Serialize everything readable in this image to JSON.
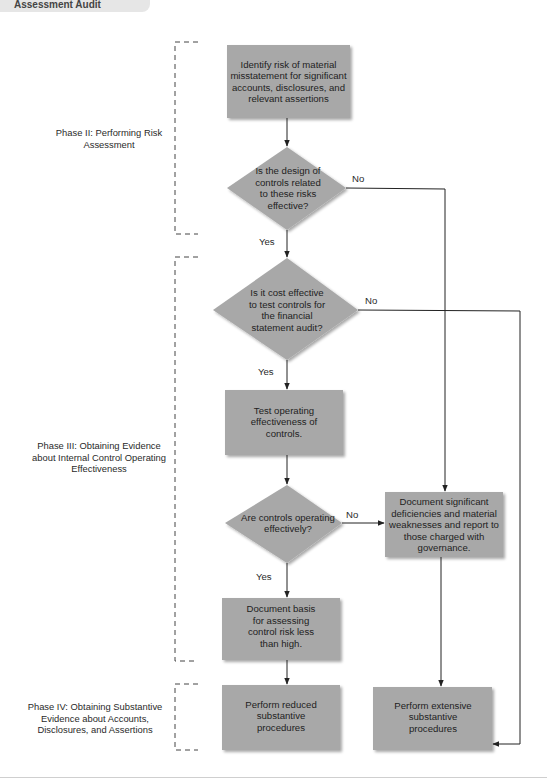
{
  "header": {
    "tab_label": "Assessment Audit"
  },
  "colors": {
    "node_fill": "#a8a8a8",
    "node_shadow": "#c9c9c9",
    "line": "#222222",
    "bracket": "#444444",
    "background": "#ffffff"
  },
  "phases": [
    {
      "id": "phase2",
      "label": "Phase II: Performing Risk Assessment"
    },
    {
      "id": "phase3",
      "label": "Phase III: Obtaining Evidence about Internal Control Operating Effectiveness"
    },
    {
      "id": "phase4",
      "label": "Phase IV: Obtaining Substantive Evidence about Accounts, Disclosures, and Assertions"
    }
  ],
  "nodes": {
    "identify_risk": {
      "type": "process",
      "text": "Identify risk of material misstatement for significant accounts, disclosures, and relevant assertions"
    },
    "design_effective": {
      "type": "decision",
      "text": "Is the design of controls related to these risks effective?"
    },
    "cost_effective": {
      "type": "decision",
      "text": "Is it cost effective to test controls for the financial statement audit?"
    },
    "test_operating": {
      "type": "process",
      "text": "Test operating effectiveness of controls."
    },
    "operating_effectively": {
      "type": "decision",
      "text": "Are controls operating effectively?"
    },
    "document_deficiencies": {
      "type": "process",
      "text": "Document significant deficiencies and material weaknesses and report to those charged with governance."
    },
    "document_basis": {
      "type": "process",
      "text": "Document basis for assessing control risk less than high."
    },
    "reduced_substantive": {
      "type": "process",
      "text": "Perform reduced substantive procedures"
    },
    "extensive_substantive": {
      "type": "process",
      "text": "Perform extensive substantive procedures"
    }
  },
  "edges": [
    {
      "from": "identify_risk",
      "to": "design_effective",
      "label": ""
    },
    {
      "from": "design_effective",
      "to": "cost_effective",
      "label": "Yes"
    },
    {
      "from": "design_effective",
      "to": "document_deficiencies",
      "label": "No"
    },
    {
      "from": "cost_effective",
      "to": "test_operating",
      "label": "Yes"
    },
    {
      "from": "cost_effective",
      "to": "extensive_substantive",
      "label": "No"
    },
    {
      "from": "test_operating",
      "to": "operating_effectively",
      "label": ""
    },
    {
      "from": "operating_effectively",
      "to": "document_basis",
      "label": "Yes"
    },
    {
      "from": "operating_effectively",
      "to": "document_deficiencies",
      "label": "No"
    },
    {
      "from": "document_basis",
      "to": "reduced_substantive",
      "label": ""
    },
    {
      "from": "document_deficiencies",
      "to": "extensive_substantive",
      "label": ""
    }
  ],
  "labels": {
    "yes": "Yes",
    "no": "No"
  }
}
